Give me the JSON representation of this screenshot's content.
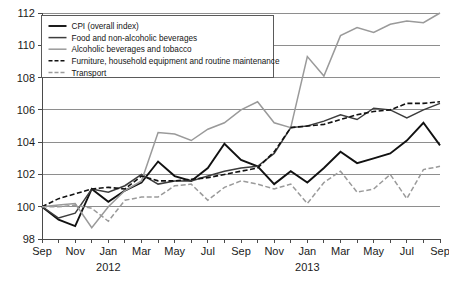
{
  "chart_data": {
    "type": "line",
    "title": "",
    "xlabel": "",
    "ylabel": "",
    "ylim": [
      98,
      112
    ],
    "yticks": [
      98,
      100,
      102,
      104,
      106,
      108,
      110,
      112
    ],
    "ytick_labels": [
      "98",
      "100",
      "102",
      "104",
      "106",
      "108",
      "110",
      "112"
    ],
    "grid": true,
    "legend_position": "top-left",
    "x": [
      "Sep 2011",
      "Oct 2011",
      "Nov 2011",
      "Dec 2011",
      "Jan 2012",
      "Feb 2012",
      "Mar 2012",
      "Apr 2012",
      "May 2012",
      "Jun 2012",
      "Jul 2012",
      "Aug 2012",
      "Sep 2012",
      "Oct 2012",
      "Nov 2012",
      "Dec 2012",
      "Jan 2013",
      "Feb 2013",
      "Mar 2013",
      "Apr 2013",
      "May 2013",
      "Jun 2013",
      "Jul 2013",
      "Aug 2013",
      "Sep 2013"
    ],
    "xtick_labels": [
      "Sep",
      "",
      "Nov",
      "",
      "Jan",
      "",
      "Mar",
      "",
      "May",
      "",
      "Jul",
      "",
      "Sep",
      "",
      "Nov",
      "",
      "Jan",
      "",
      "Mar",
      "",
      "May",
      "",
      "Jul",
      "",
      "Sep"
    ],
    "xtick_labels_visible": [
      "Sep",
      "Nov",
      "Jan",
      "Mar",
      "May",
      "Jul",
      "Sep",
      "Nov",
      "Jan",
      "Mar",
      "May",
      "Jul",
      "Sep"
    ],
    "year_labels": [
      {
        "label": "2012",
        "at": "Jan 2012"
      },
      {
        "label": "2013",
        "at": "Jan 2013"
      }
    ],
    "series": [
      {
        "name": "CPI (overall index)",
        "key": "cpi",
        "color": "#111111",
        "width": 1.9,
        "dash": "none",
        "values": [
          100.0,
          99.2,
          98.8,
          101.1,
          100.3,
          101.0,
          101.5,
          102.8,
          101.9,
          101.6,
          102.4,
          103.9,
          102.9,
          102.5,
          101.4,
          102.2,
          101.5,
          102.4,
          103.4,
          102.7,
          103.0,
          103.3,
          104.1,
          105.2,
          103.8
        ]
      },
      {
        "name": "Food and non-alcoholic beverages",
        "key": "food",
        "color": "#3d3d3d",
        "width": 1.5,
        "dash": "none",
        "values": [
          100.0,
          99.3,
          99.6,
          101.1,
          100.9,
          101.3,
          102.0,
          101.4,
          101.6,
          101.6,
          101.9,
          102.2,
          102.4,
          102.5,
          103.3,
          104.9,
          105.0,
          105.3,
          105.7,
          105.4,
          106.1,
          106.0,
          105.5,
          106.0,
          106.4
        ]
      },
      {
        "name": "Alcoholic beverages and tobacco",
        "key": "alcohol",
        "color": "#9a9a9a",
        "width": 1.5,
        "dash": "none",
        "values": [
          100.0,
          100.1,
          100.2,
          98.7,
          100.0,
          101.0,
          101.6,
          104.6,
          104.5,
          104.1,
          104.8,
          105.2,
          106.0,
          106.5,
          105.2,
          104.9,
          109.3,
          108.1,
          110.6,
          111.1,
          110.8,
          111.3,
          111.5,
          111.4,
          112.0
        ]
      },
      {
        "name": "Furniture, household equipment and routine maintenance",
        "key": "furniture",
        "color": "#111111",
        "width": 1.6,
        "dash": "5,2.5",
        "values": [
          100.0,
          100.5,
          100.8,
          101.1,
          101.2,
          101.1,
          101.9,
          101.6,
          101.6,
          101.7,
          101.8,
          102.0,
          102.2,
          102.4,
          103.4,
          104.9,
          105.0,
          105.1,
          105.4,
          105.7,
          105.9,
          106.0,
          106.4,
          106.4,
          106.5
        ]
      },
      {
        "name": "Transport",
        "key": "transport",
        "color": "#9a9a9a",
        "width": 1.5,
        "dash": "5,2.5",
        "values": [
          100.0,
          100.0,
          100.1,
          99.9,
          99.1,
          100.4,
          100.6,
          100.6,
          101.3,
          101.4,
          100.4,
          101.2,
          101.6,
          101.4,
          101.1,
          101.4,
          100.2,
          101.5,
          102.2,
          100.9,
          101.1,
          102.0,
          100.5,
          102.3,
          102.5
        ]
      }
    ]
  },
  "legend": {
    "entries": [
      {
        "label": "CPI (overall index)",
        "key": "cpi"
      },
      {
        "label": "Food and non-alcoholic beverages",
        "key": "food"
      },
      {
        "label": "Alcoholic beverages and tobacco",
        "key": "alcohol"
      },
      {
        "label": "Furniture, household equipment and routine maintenance",
        "key": "furniture"
      },
      {
        "label": "Transport",
        "key": "transport"
      }
    ]
  }
}
